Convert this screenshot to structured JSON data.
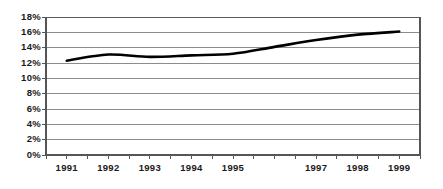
{
  "chart_data": {
    "type": "line",
    "title": "",
    "subtitle": "",
    "xlabel": "",
    "ylabel": "",
    "categories": [
      "1991",
      "1992",
      "1993",
      "1994",
      "1995",
      "",
      "1997",
      "1998",
      "1999"
    ],
    "x_tick_labels": [
      "1991",
      "1992",
      "1993",
      "1994",
      "1995",
      "",
      "1997",
      "1998",
      "1999"
    ],
    "y_tick_labels": [
      "0%",
      "2%",
      "4%",
      "6%",
      "8%",
      "10%",
      "12%",
      "14%",
      "16%",
      "18%"
    ],
    "values": [
      12.3,
      13.1,
      12.8,
      13.0,
      13.2,
      14.1,
      15.0,
      15.7,
      16.1
    ],
    "series": [
      {
        "name": "",
        "values": [
          12.3,
          13.1,
          12.8,
          13.0,
          13.2,
          14.1,
          15.0,
          15.7,
          16.1
        ]
      }
    ],
    "ylim": [
      0,
      18
    ],
    "y_tick_step": 2,
    "grid": true,
    "grid_axis": "y",
    "legend": false,
    "legend_position": "none",
    "unit": "%",
    "line_color": "#000000",
    "line_width": 2.6,
    "grid_color": "#808080",
    "axis_color": "#555555",
    "background_color": "#ffffff",
    "text_color": "#1a1a1a"
  },
  "layout": {
    "plot_left": 46,
    "plot_right": 420,
    "plot_top": 17,
    "plot_bottom": 155
  }
}
